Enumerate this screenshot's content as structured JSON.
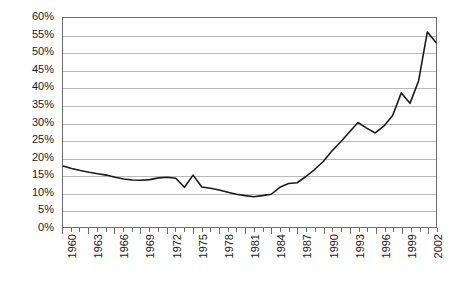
{
  "chart_data": {
    "type": "line",
    "title": "",
    "subtitle": "",
    "xlabel": "",
    "ylabel": "",
    "xlim": [
      1960,
      2003
    ],
    "ylim": [
      0,
      60
    ],
    "grid": true,
    "legend": "none",
    "y_ticks": [
      "0%",
      "5%",
      "10%",
      "15%",
      "20%",
      "25%",
      "30%",
      "35%",
      "40%",
      "45%",
      "50%",
      "55%",
      "60%"
    ],
    "y_tick_values": [
      0,
      5,
      10,
      15,
      20,
      25,
      30,
      35,
      40,
      45,
      50,
      55,
      60
    ],
    "x_tick_labels": [
      "1960",
      "1963",
      "1966",
      "1969",
      "1972",
      "1975",
      "1978",
      "1981",
      "1984",
      "1987",
      "1990",
      "1993",
      "1996",
      "1999",
      "2002"
    ],
    "x_tick_label_values": [
      1960,
      1963,
      1966,
      1969,
      1972,
      1975,
      1978,
      1981,
      1984,
      1987,
      1990,
      1993,
      1996,
      1999,
      2002
    ],
    "x": [
      1960,
      1961,
      1962,
      1963,
      1964,
      1965,
      1966,
      1967,
      1968,
      1969,
      1970,
      1971,
      1972,
      1973,
      1974,
      1975,
      1976,
      1977,
      1978,
      1979,
      1980,
      1981,
      1982,
      1983,
      1984,
      1985,
      1986,
      1987,
      1988,
      1989,
      1990,
      1991,
      1992,
      1993,
      1994,
      1995,
      1996,
      1997,
      1998,
      1999,
      2000,
      2001,
      2002,
      2003
    ],
    "values": [
      17.5,
      16.8,
      16.2,
      15.7,
      15.3,
      14.9,
      14.3,
      13.8,
      13.5,
      13.4,
      13.6,
      14.1,
      14.3,
      14.0,
      11.4,
      14.9,
      11.5,
      11.1,
      10.6,
      10.0,
      9.4,
      9.0,
      8.7,
      9.0,
      9.4,
      11.4,
      12.5,
      12.7,
      14.5,
      16.5,
      18.8,
      21.8,
      24.4,
      27.2,
      30.0,
      28.4,
      27.0,
      29.0,
      32.0,
      38.5,
      35.5,
      42.0,
      56.0,
      53.0
    ],
    "line_color": "#1a1a1a",
    "line_width": 1.6,
    "grid_color": "#b9b9b9",
    "frame_color": "#6e6e6e",
    "background_color": "#ffffff"
  }
}
